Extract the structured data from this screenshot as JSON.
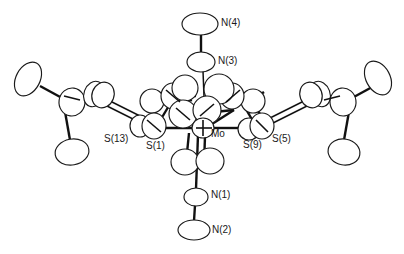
{
  "figure": {
    "kind": "ortep-crystal-structure-diagram",
    "background_color": "#ffffff",
    "line_color": "#111111",
    "ellipsoid_fill": "#ffffff",
    "width": 404,
    "height": 254
  },
  "labels": {
    "n4": "N(4)",
    "n3": "N(3)",
    "n1": "N(1)",
    "n2": "N(2)",
    "mo": "Mo",
    "s1": "S(1)",
    "s13": "S(13)",
    "s5": "S(5)",
    "s9": "S(9)"
  },
  "atoms": [
    {
      "name": "N(4)",
      "label": "N(4)",
      "element": "N",
      "cx": 200,
      "cy": 24,
      "rx": 16,
      "ry": 10,
      "rot": 0,
      "labeled": true
    },
    {
      "name": "N(3)",
      "label": "N(3)",
      "element": "N",
      "cx": 201,
      "cy": 62,
      "rx": 13,
      "ry": 9,
      "rot": 0,
      "labeled": true
    },
    {
      "name": "N(1)",
      "label": "N(1)",
      "element": "N",
      "cx": 196,
      "cy": 197,
      "rx": 11,
      "ry": 8,
      "rot": 0,
      "labeled": true
    },
    {
      "name": "N(2)",
      "label": "N(2)",
      "element": "N",
      "cx": 194,
      "cy": 230,
      "rx": 15,
      "ry": 9,
      "rot": 0,
      "labeled": true
    },
    {
      "name": "Mo",
      "label": "Mo",
      "element": "Mo",
      "cx": 205,
      "cy": 127,
      "rx": 11,
      "ry": 9,
      "rot": 0,
      "labeled": true
    },
    {
      "name": "S(1)",
      "label": "S(1)",
      "element": "S",
      "cx": 153,
      "cy": 129,
      "rx": 11,
      "ry": 9,
      "rot": 0,
      "labeled": true
    },
    {
      "name": "S(13)",
      "label": "S(13)",
      "element": "S",
      "cx": 140,
      "cy": 126,
      "rx": 9,
      "ry": 8,
      "rot": 0,
      "labeled": true
    },
    {
      "name": "S(9)",
      "label": "S(9)",
      "element": "S",
      "cx": 248,
      "cy": 128,
      "rx": 10,
      "ry": 9,
      "rot": 0,
      "labeled": true
    },
    {
      "name": "S(5)",
      "label": "S(5)",
      "element": "S",
      "cx": 261,
      "cy": 127,
      "rx": 11,
      "ry": 9,
      "rot": 0,
      "labeled": true
    }
  ],
  "label_positions": [
    {
      "name": "N(4)",
      "text": "N(4)",
      "left": 221,
      "top": 18
    },
    {
      "name": "N(3)",
      "text": "N(3)",
      "left": 218,
      "top": 56
    },
    {
      "name": "N(1)",
      "text": "N(1)",
      "left": 211,
      "top": 190
    },
    {
      "name": "N(2)",
      "text": "N(2)",
      "left": 212,
      "top": 224
    },
    {
      "name": "Mo",
      "text": "Mo",
      "left": 211,
      "top": 128
    },
    {
      "name": "S(1)",
      "text": "S(1)",
      "left": 146,
      "top": 140
    },
    {
      "name": "S(13)",
      "text": "S(13)",
      "left": 105,
      "top": 133
    },
    {
      "name": "S(9)",
      "text": "S(9)",
      "left": 243,
      "top": 139
    },
    {
      "name": "S(5)",
      "text": "S(5)",
      "left": 272,
      "top": 133
    }
  ],
  "caption": ""
}
